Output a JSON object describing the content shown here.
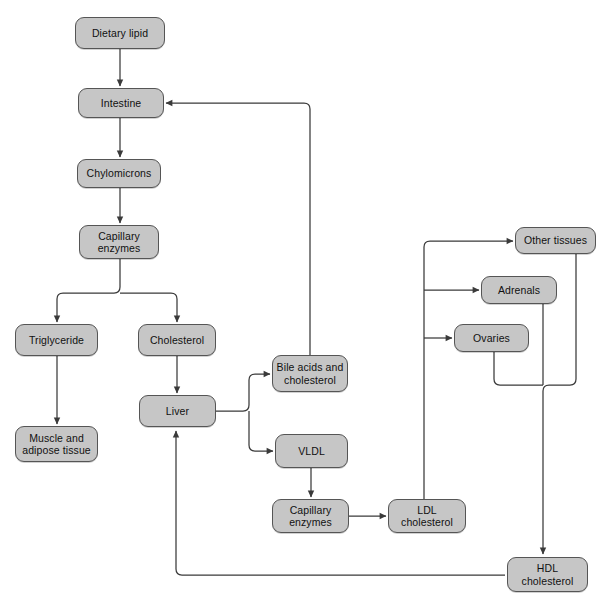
{
  "diagram": {
    "style": {
      "node_fill": "#c6c6c6",
      "node_border": "#555555",
      "edge_color": "#3a3a3a",
      "background": "#ffffff"
    },
    "nodes": [
      {
        "id": "dietary_lipid",
        "label": "Dietary lipid",
        "x": 75,
        "y": 17,
        "w": 90,
        "h": 32
      },
      {
        "id": "intestine",
        "label": "Intestine",
        "x": 78,
        "y": 88,
        "w": 86,
        "h": 30
      },
      {
        "id": "chylomicrons",
        "label": "Chylomicrons",
        "x": 77,
        "y": 159,
        "w": 84,
        "h": 29
      },
      {
        "id": "capillary_enz_1",
        "label": "Capillary\nenzymes",
        "x": 79,
        "y": 225,
        "w": 80,
        "h": 34
      },
      {
        "id": "triglyceride",
        "label": "Triglyceride",
        "x": 15,
        "y": 324,
        "w": 83,
        "h": 32
      },
      {
        "id": "cholesterol",
        "label": "Cholesterol",
        "x": 138,
        "y": 324,
        "w": 78,
        "h": 32
      },
      {
        "id": "muscle_adipose",
        "label": "Muscle and\nadipose tissue",
        "x": 15,
        "y": 426,
        "w": 83,
        "h": 36
      },
      {
        "id": "liver",
        "label": "Liver",
        "x": 139,
        "y": 395,
        "w": 77,
        "h": 32
      },
      {
        "id": "bile_acids",
        "label": "Bile acids and\ncholesterol",
        "x": 272,
        "y": 355,
        "w": 76,
        "h": 37
      },
      {
        "id": "vldl",
        "label": "VLDL",
        "x": 275,
        "y": 434,
        "w": 73,
        "h": 34
      },
      {
        "id": "capillary_enz_2",
        "label": "Capillary\nenzymes",
        "x": 272,
        "y": 499,
        "w": 77,
        "h": 34
      },
      {
        "id": "ldl_cholesterol",
        "label": "LDL\ncholesterol",
        "x": 388,
        "y": 499,
        "w": 78,
        "h": 34
      },
      {
        "id": "other_tissues",
        "label": "Other tissues",
        "x": 515,
        "y": 227,
        "w": 81,
        "h": 27
      },
      {
        "id": "adrenals",
        "label": "Adrenals",
        "x": 481,
        "y": 276,
        "w": 76,
        "h": 28
      },
      {
        "id": "ovaries",
        "label": "Ovaries",
        "x": 454,
        "y": 324,
        "w": 75,
        "h": 28
      },
      {
        "id": "hdl_cholesterol",
        "label": "HDL\ncholesterol",
        "x": 507,
        "y": 557,
        "w": 81,
        "h": 35
      }
    ],
    "edges": [
      {
        "id": "dietary-to-intestine",
        "from": "dietary_lipid",
        "to": "intestine",
        "path": "M 120,49 L 120,86",
        "arrow": "down"
      },
      {
        "id": "intestine-to-chylomicrons",
        "from": "intestine",
        "to": "chylomicrons",
        "path": "M 120,118 L 120,157",
        "arrow": "down"
      },
      {
        "id": "chylomicrons-to-capillary",
        "from": "chylomicrons",
        "to": "capillary_enz_1",
        "path": "M 120,188 L 120,223",
        "arrow": "down"
      },
      {
        "id": "capillary-split-left",
        "from": "capillary_enz_1",
        "to": "triglyceride",
        "path": "M 120,259 L 120,287 Q 120,293 114,293 L 63,293 Q 57,293 57,299 L 57,322",
        "arrow": "down"
      },
      {
        "id": "capillary-split-right",
        "from": "capillary_enz_1",
        "to": "cholesterol",
        "path": "M 120,293 Q 120,293 126,293 L 171,293 Q 177,293 177,299 L 177,322",
        "arrow": "down"
      },
      {
        "id": "triglyceride-to-muscle",
        "from": "triglyceride",
        "to": "muscle_adipose",
        "path": "M 57,356 L 57,424",
        "arrow": "down"
      },
      {
        "id": "cholesterol-to-liver",
        "from": "cholesterol",
        "to": "liver",
        "path": "M 177,356 L 177,393",
        "arrow": "down"
      },
      {
        "id": "liver-to-bile-acids",
        "from": "liver",
        "to": "bile_acids",
        "path": "M 216,411 L 243,411 Q 249,411 249,405 L 249,380 Q 249,374 255,374 L 270,374",
        "arrow": "right"
      },
      {
        "id": "liver-to-vldl",
        "from": "liver",
        "to": "vldl",
        "path": "M 249,411 Q 249,411 249,417 L 249,445 Q 249,451 255,451 L 273,451",
        "arrow": "right"
      },
      {
        "id": "bile-acids-to-intestine",
        "from": "bile_acids",
        "to": "intestine",
        "path": "M 310,355 L 310,109 Q 310,103 304,103 L 166,103",
        "arrow": "left"
      },
      {
        "id": "vldl-to-capillary2",
        "from": "vldl",
        "to": "capillary_enz_2",
        "path": "M 311,468 L 311,497",
        "arrow": "down"
      },
      {
        "id": "capillary2-to-ldl",
        "from": "capillary_enz_2",
        "to": "ldl_cholesterol",
        "path": "M 349,516 L 386,516",
        "arrow": "right"
      },
      {
        "id": "ldl-to-other-tissues",
        "from": "ldl_cholesterol",
        "to": "other_tissues",
        "path": "M 424,499 L 424,247 Q 424,241 430,241 L 513,241",
        "arrow": "right"
      },
      {
        "id": "ldl-to-adrenals",
        "from": "ldl_cholesterol",
        "to": "adrenals",
        "path": "M 424,290 Q 424,290 430,290 L 479,290",
        "arrow": "right"
      },
      {
        "id": "ldl-to-ovaries",
        "from": "ldl_cholesterol",
        "to": "ovaries",
        "path": "M 424,338 Q 424,338 430,338 L 452,338",
        "arrow": "right"
      },
      {
        "id": "other-tissues-to-hdl",
        "from": "other_tissues",
        "to": "hdl_cholesterol",
        "path": "M 576,254 L 576,379 Q 576,385 570,385 L 549,385 Q 543,385 543,391 L 543,554",
        "arrow": "down"
      },
      {
        "id": "adrenals-to-merge",
        "from": "adrenals",
        "to": "hdl_cholesterol",
        "path": "M 543,304 L 543,385",
        "arrow": "none"
      },
      {
        "id": "ovaries-to-merge",
        "from": "ovaries",
        "to": "hdl_cholesterol",
        "path": "M 494,352 L 494,379 Q 494,385 500,385 L 543,385",
        "arrow": "none"
      },
      {
        "id": "hdl-to-liver",
        "from": "hdl_cholesterol",
        "to": "liver",
        "path": "M 505,575 L 182,575 Q 176,575 176,569 L 176,431",
        "arrow": "up"
      }
    ]
  }
}
